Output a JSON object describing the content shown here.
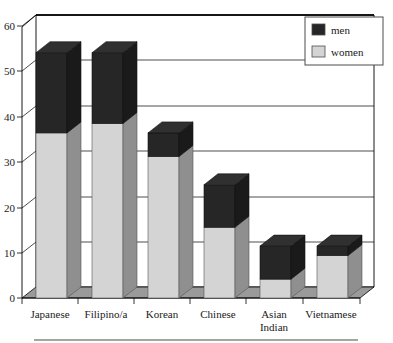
{
  "chart_data": {
    "type": "bar",
    "subtype": "stacked-3d-column",
    "title": "",
    "xlabel": "",
    "ylabel": "",
    "categories": [
      "Japanese",
      "Filipino/a",
      "Asian Indian",
      "Korean",
      "Chinese",
      "Vietnamese"
    ],
    "category_order": [
      "Japanese",
      "Filipino/a",
      "Korean",
      "Chinese",
      "Asian Indian",
      "Vietnamese"
    ],
    "series": [
      {
        "name": "women",
        "color": "#d4d4d4",
        "values": [
          35,
          37,
          30,
          15,
          4,
          9
        ]
      },
      {
        "name": "men",
        "color": "#262626",
        "values": [
          17,
          15,
          5,
          9,
          7,
          2
        ]
      }
    ],
    "totals": [
      52,
      52,
      35,
      24,
      11,
      11
    ],
    "ylim": [
      0,
      60
    ],
    "yticks": [
      0,
      10,
      20,
      30,
      40,
      50,
      60
    ],
    "ytick_labels": [
      "0",
      "10",
      "20",
      "30",
      "40",
      "50",
      "60"
    ],
    "grid": true,
    "grid_orientation": "horizontal",
    "legend_position": "top-right",
    "legend_entries": [
      "men",
      "women"
    ]
  },
  "axis": {
    "y_tick_labels": [
      "60",
      "50",
      "40",
      "30",
      "20",
      "10",
      "0"
    ]
  },
  "categories": [
    {
      "line1": "Japanese",
      "line2": ""
    },
    {
      "line1": "Filipino/a",
      "line2": ""
    },
    {
      "line1": "Korean",
      "line2": ""
    },
    {
      "line1": "Chinese",
      "line2": ""
    },
    {
      "line1": "Asian",
      "line2": "Indian"
    },
    {
      "line1": "Vietnamese",
      "line2": ""
    }
  ],
  "legend": {
    "items": [
      {
        "label": "men",
        "swatch": "#262626"
      },
      {
        "label": "women",
        "swatch": "#d4d4d4"
      }
    ]
  },
  "colors": {
    "men_front": "#262626",
    "men_side": "#1a1a1a",
    "men_top": "#303030",
    "women_front": "#d4d4d4",
    "women_side": "#8f8f8f",
    "floor": "#9a9a9a",
    "frame": "#000000",
    "grid": "#000000",
    "background": "#ffffff",
    "rule": "#4d4d4d"
  }
}
